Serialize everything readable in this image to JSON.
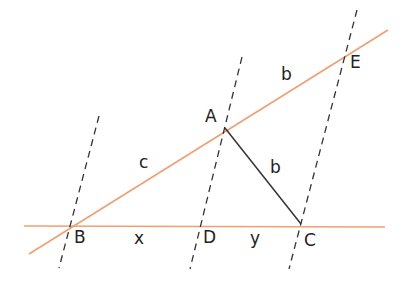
{
  "diagram": {
    "colors": {
      "orange_line": "#f0a070",
      "dashed_line": "#333333",
      "segment": "#333333"
    },
    "points": {
      "A": "A",
      "B": "B",
      "C": "C",
      "D": "D",
      "E": "E"
    },
    "segment_labels": {
      "BA": "c",
      "AE": "b",
      "AC": "b",
      "BD": "x",
      "DC": "y"
    }
  }
}
